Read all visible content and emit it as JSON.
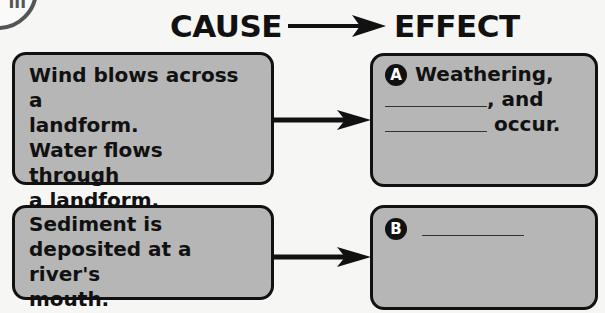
{
  "badge": {
    "label": "ill"
  },
  "header": {
    "cause_label": "CAUSE",
    "effect_label": "EFFECT",
    "arrow_icon": "right-arrow-icon"
  },
  "rows": [
    {
      "cause": {
        "lines": [
          "Wind blows across a",
          "landform.",
          "Water flows through",
          "a landform."
        ]
      },
      "effect": {
        "marker": "A",
        "line1": "Weathering,",
        "line2_suffix": ", and",
        "line3_suffix": "occur."
      }
    },
    {
      "cause": {
        "lines": [
          "Sediment is",
          "deposited at a river's",
          "mouth."
        ]
      },
      "effect": {
        "marker": "B"
      }
    }
  ],
  "colors": {
    "box_fill": "#b6b6b6",
    "border": "#111111",
    "background": "#f6f6f4"
  }
}
